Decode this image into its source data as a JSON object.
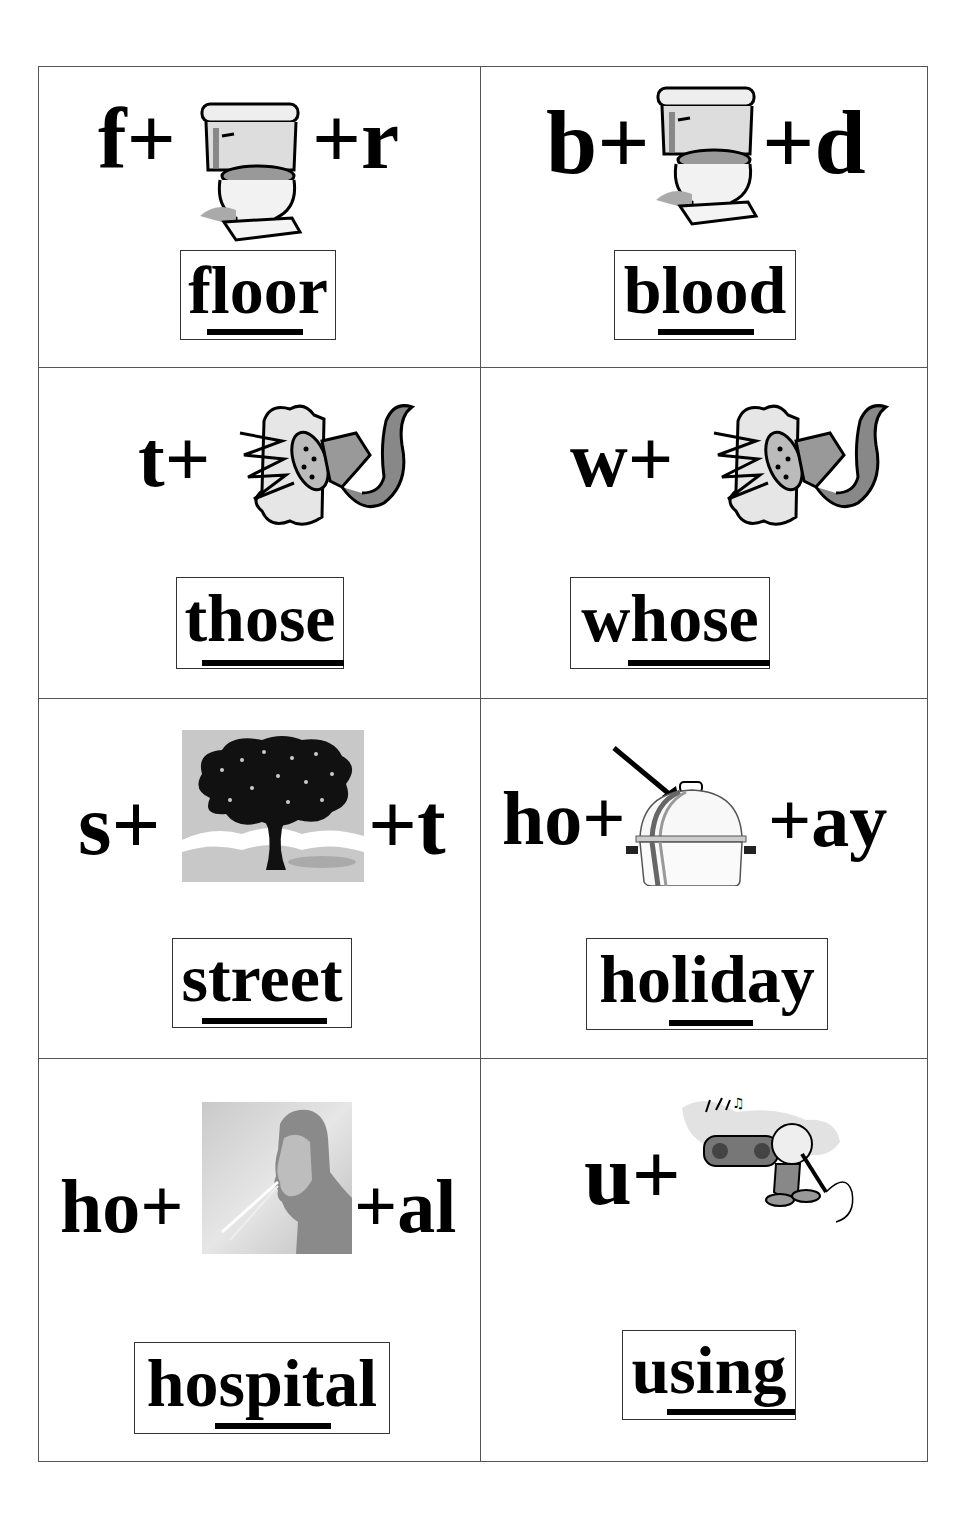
{
  "worksheet": {
    "cards": [
      {
        "id": "floor",
        "prefix": "f+",
        "suffix": "+r",
        "picture": "toilet-icon",
        "word": "floor",
        "underlined_part": "oo"
      },
      {
        "id": "blood",
        "prefix": "b+",
        "suffix": "+d",
        "picture": "toilet-icon",
        "word": "blood",
        "underlined_part": "oo"
      },
      {
        "id": "those",
        "prefix": "t+",
        "suffix": "",
        "picture": "hose-icon",
        "word": "those",
        "underlined_part": "hose"
      },
      {
        "id": "whose",
        "prefix": "w+",
        "suffix": "",
        "picture": "hose-icon",
        "word": "whose",
        "underlined_part": "hose"
      },
      {
        "id": "street",
        "prefix": "s+",
        "suffix": "+t",
        "picture": "tree-icon",
        "word": "street",
        "underlined_part": "tree"
      },
      {
        "id": "holiday",
        "prefix": "ho+",
        "suffix": "+ay",
        "picture": "lid-pot-icon",
        "word": "holiday",
        "underlined_part": "lid"
      },
      {
        "id": "hospital",
        "prefix": "ho+",
        "suffix": "+al",
        "picture": "man-spitting-icon",
        "word": "hospital",
        "underlined_part": "spit"
      },
      {
        "id": "using",
        "prefix": "u+",
        "suffix": "",
        "picture": "singing-boy-icon",
        "word": "using",
        "underlined_part": "sing"
      }
    ]
  }
}
